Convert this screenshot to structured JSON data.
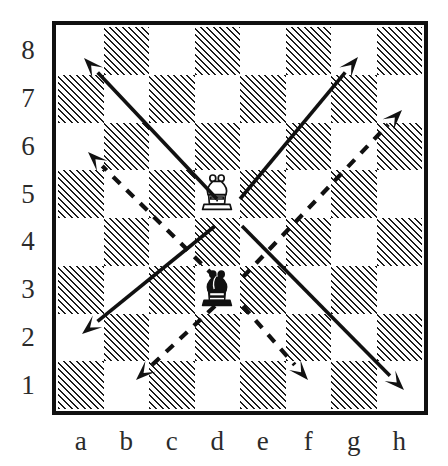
{
  "diagram": {
    "board": {
      "files": [
        "a",
        "b",
        "c",
        "d",
        "e",
        "f",
        "g",
        "h"
      ],
      "ranks": [
        "8",
        "7",
        "6",
        "5",
        "4",
        "3",
        "2",
        "1"
      ],
      "size": 8,
      "light_square_color": "#ffffff",
      "dark_square_fill": "hatched",
      "hatch_color": "#1d1d1d",
      "border_color": "#111111"
    },
    "pieces": [
      {
        "id": "white-bishop",
        "type": "bishop",
        "color": "white",
        "square": "d5",
        "file_index": 3,
        "rank_index": 3,
        "fill": "#ffffff",
        "stroke": "#111111"
      },
      {
        "id": "black-bishop",
        "type": "bishop",
        "color": "black",
        "square": "d3",
        "file_index": 3,
        "rank_index": 5,
        "fill": "#111111",
        "stroke": "#111111"
      }
    ],
    "arrows": [
      {
        "id": "white-up-left",
        "style": "solid",
        "from": "d5",
        "to": "a8",
        "x1": 217,
        "y1": 199,
        "x2": 84,
        "y2": 58,
        "color": "#111111"
      },
      {
        "id": "white-up-right",
        "style": "solid",
        "from": "d5",
        "to": "g8",
        "x1": 240,
        "y1": 199,
        "x2": 358,
        "y2": 57,
        "color": "#111111"
      },
      {
        "id": "white-down-left",
        "style": "solid",
        "from": "d5",
        "to": "a2",
        "x1": 215,
        "y1": 226,
        "x2": 82,
        "y2": 334,
        "color": "#111111"
      },
      {
        "id": "white-down-right",
        "style": "solid",
        "from": "d5",
        "to": "h1",
        "x1": 242,
        "y1": 226,
        "x2": 404,
        "y2": 390,
        "color": "#111111"
      },
      {
        "id": "black-up-left",
        "style": "dashed",
        "from": "d3",
        "to": "a6",
        "x1": 215,
        "y1": 277,
        "x2": 88,
        "y2": 152,
        "color": "#111111"
      },
      {
        "id": "black-up-right",
        "style": "dashed",
        "from": "d3",
        "to": "h7",
        "x1": 243,
        "y1": 277,
        "x2": 402,
        "y2": 110,
        "color": "#111111"
      },
      {
        "id": "black-down-left",
        "style": "dashed",
        "from": "d3",
        "to": "b1",
        "x1": 215,
        "y1": 306,
        "x2": 136,
        "y2": 380,
        "color": "#111111"
      },
      {
        "id": "black-down-right",
        "style": "dashed",
        "from": "d3",
        "to": "f1",
        "x1": 243,
        "y1": 306,
        "x2": 308,
        "y2": 380,
        "color": "#111111"
      }
    ],
    "legend": {
      "solid_meaning": "white bishop moves",
      "dashed_meaning": "black bishop moves"
    }
  }
}
